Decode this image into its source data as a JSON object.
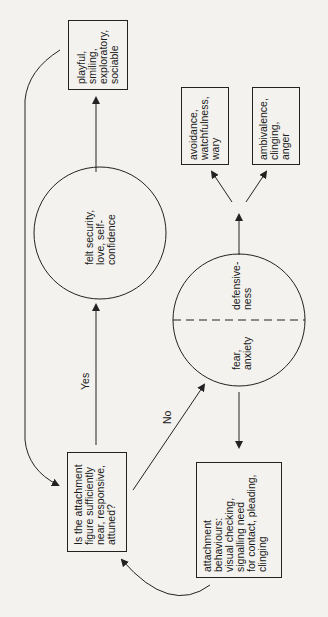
{
  "diagram": {
    "orientation": "rotated -90deg",
    "nodes": {
      "question": {
        "shape": "box",
        "text": "Is the attachment\nfigure sufficiently\nnear, responsive,\nattuned?"
      },
      "secure": {
        "shape": "circle",
        "text": "felt security,\nlove, self-\nconfidence"
      },
      "outcome_secure": {
        "shape": "box",
        "text": "playful,\nsmiling,\nexploratory,\nsociable"
      },
      "fear": {
        "shape": "circle-half",
        "text": "fear,\nanxiety"
      },
      "defensive": {
        "shape": "circle-half",
        "text": "defensive-\nness"
      },
      "avoidance": {
        "shape": "box",
        "text": "avoidance,\nwatchfulness,\nwary"
      },
      "ambivalence": {
        "shape": "box",
        "text": "ambivalence,\nclinging,\nanger"
      },
      "attachment_behaviours": {
        "shape": "box",
        "text": "attachment\nbehaviours:\nvisual checking,\nsignalling need\nfor contact, pleading,\nclinging"
      }
    },
    "edge_labels": {
      "yes": "Yes",
      "no": "No"
    },
    "colors": {
      "line": "#222222",
      "background": "#f3f2ee"
    }
  }
}
